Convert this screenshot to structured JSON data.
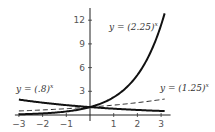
{
  "chart_data": {
    "type": "line",
    "title": "",
    "xlabel": "",
    "ylabel": "",
    "xlim": [
      -3,
      3.15
    ],
    "ylim": [
      0,
      13
    ],
    "grid": false,
    "x_ticks": [
      -3,
      -2,
      -1,
      1,
      2,
      3
    ],
    "x_tick_labels": [
      "−3",
      "−2",
      "−1",
      "1",
      "2",
      "3"
    ],
    "y_ticks": [
      3,
      6,
      9,
      12
    ],
    "y_tick_labels": [
      "3",
      "6",
      "9",
      "12"
    ],
    "series": [
      {
        "name": "y = (2.25)^x",
        "base": 2.25,
        "style": "solid-bold",
        "label": "y = (2.25)",
        "exp": "x"
      },
      {
        "name": "y = (1.25)^x",
        "base": 1.25,
        "style": "dashed",
        "label": "y = (1.25)",
        "exp": "x"
      },
      {
        "name": "y = (.8)^x",
        "base": 0.8,
        "style": "solid-bold",
        "label": "y = (.8)",
        "exp": "x"
      }
    ],
    "annotations": [
      "y = (2.25)^x",
      "y = (1.25)^x",
      "y = (.8)^x"
    ]
  }
}
